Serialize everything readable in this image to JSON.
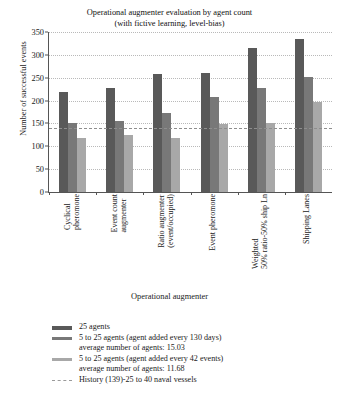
{
  "chart_data": {
    "type": "bar",
    "title_line1": "Operational augmenter evaluation by agent count",
    "title_line2": "(with fictive learning, level-bias)",
    "xlabel": "Operational augmenter",
    "ylabel": "Number of successful events",
    "ylim": [
      0,
      350
    ],
    "yticks": [
      0,
      50,
      100,
      150,
      200,
      250,
      300,
      350
    ],
    "grid": true,
    "legend_position": "bottom-left",
    "categories": [
      "Cyclical pheromone",
      "Event count augmenter",
      "Ratio augmenter (event/occupied)",
      "Event pheromone",
      "Weighted 50% ratio-50% ship Ln",
      "Shipping Lanes"
    ],
    "category_lines": [
      [
        "Cyclical",
        "pheromone"
      ],
      [
        "Event count",
        "augmenter"
      ],
      [
        "Ratio augmenter",
        "(event/occupied)"
      ],
      [
        "Event pheromone"
      ],
      [
        "Weighted",
        "50% ratio-50% ship Ln"
      ],
      [
        "Shipping Lanes"
      ]
    ],
    "series": [
      {
        "name": "25 agents",
        "color": "#595959",
        "values": [
          218,
          228,
          258,
          260,
          315,
          335
        ]
      },
      {
        "name": "5 to 25 agents (agent added every 130 days)",
        "color": "#787878",
        "values": [
          152,
          155,
          172,
          207,
          228,
          252
        ]
      },
      {
        "name": "5 to 25 agents (agent added every 42 events)",
        "color": "#a8a8a8",
        "values": [
          118,
          125,
          118,
          148,
          152,
          197
        ]
      }
    ],
    "reference_line": {
      "name": "History (139)-25 to 40 naval vessels",
      "value": 139,
      "style": "dashed",
      "color": "#8e8e8e"
    }
  },
  "legend": {
    "items": [
      {
        "swatch": "solid",
        "color": "#595959",
        "lines": [
          "25 agents"
        ]
      },
      {
        "swatch": "solid",
        "color": "#787878",
        "lines": [
          "5 to 25 agents (agent added every 130 days)",
          "average number of agents: 15.03"
        ]
      },
      {
        "swatch": "solid",
        "color": "#a8a8a8",
        "lines": [
          "5 to 25 agents (agent added every 42 events)",
          "average number of agents: 11.68"
        ]
      },
      {
        "swatch": "dashed",
        "color": "#9a9a9a",
        "lines": [
          "History (139)-25 to 40 naval vessels"
        ]
      }
    ]
  }
}
